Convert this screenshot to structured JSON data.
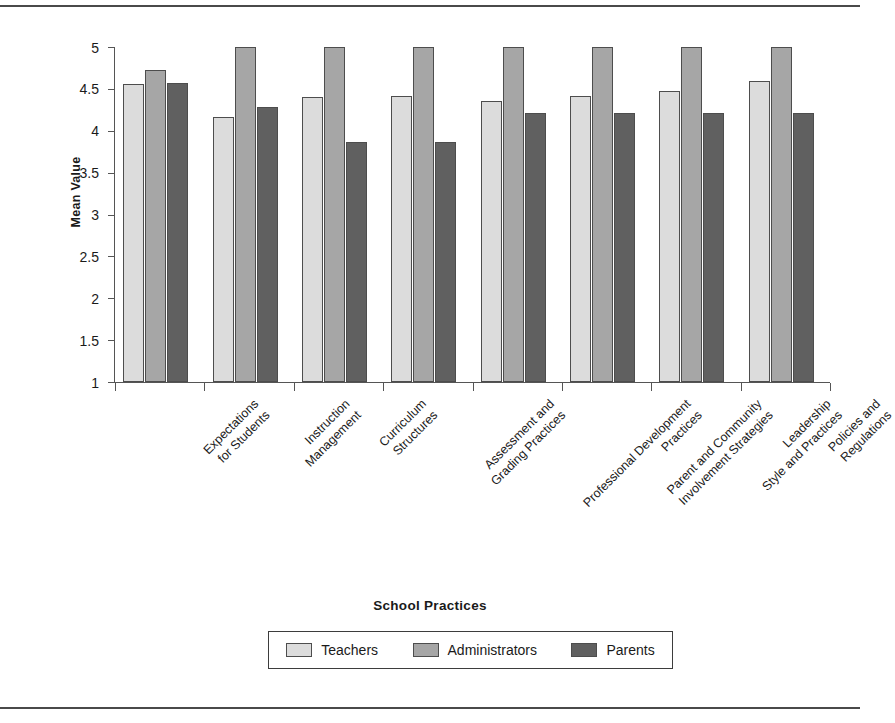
{
  "chart_data": {
    "type": "bar",
    "title": "",
    "xlabel": "School Practices",
    "ylabel": "Mean Value",
    "ylim": [
      1,
      5
    ],
    "ytick_labels": [
      "5",
      "4.5",
      "4",
      "3.5",
      "3",
      "2.5",
      "2",
      "1.5",
      "1"
    ],
    "ytick_values": [
      5,
      4.5,
      4,
      3.5,
      3,
      2.5,
      2,
      1.5,
      1
    ],
    "grid": false,
    "legend_position": "bottom",
    "categories": [
      "Expectations\nfor Students",
      "Instruction\nManagement",
      "Curriculum\nStructures",
      "Assessment and\nGrading Practices",
      "Professional Development\nPractices",
      "Parent and Community\nInvolvement Strategies",
      "Leadership\nStyle and Practices",
      "Policies and\nRegulations"
    ],
    "category_lines": [
      [
        "Expectations",
        "for Students"
      ],
      [
        "Instruction",
        "Management"
      ],
      [
        "Curriculum",
        "Structures"
      ],
      [
        "Assessment and",
        "Grading Practices"
      ],
      [
        "Professional Development",
        "Practices"
      ],
      [
        "Parent and Community",
        "Involvement Strategies"
      ],
      [
        "Leadership",
        "Style and Practices"
      ],
      [
        "Policies and",
        "Regulations"
      ]
    ],
    "series": [
      {
        "name": "Teachers",
        "color": "#dcdcdc",
        "values": [
          4.56,
          4.17,
          4.4,
          4.41,
          4.35,
          4.41,
          4.48,
          4.6
        ]
      },
      {
        "name": "Administrators",
        "color": "#a6a6a6",
        "values": [
          4.72,
          5.0,
          5.0,
          5.0,
          5.0,
          5.0,
          5.0,
          5.0
        ]
      },
      {
        "name": "Parents",
        "color": "#606060",
        "values": [
          4.57,
          4.28,
          3.86,
          3.86,
          4.21,
          4.21,
          4.21,
          4.21
        ]
      }
    ]
  },
  "legend": {
    "items": [
      {
        "label": "Teachers",
        "color": "#dcdcdc"
      },
      {
        "label": "Administrators",
        "color": "#a6a6a6"
      },
      {
        "label": "Parents",
        "color": "#606060"
      }
    ]
  },
  "colors": {
    "teachers": "#dcdcdc",
    "administrators": "#a6a6a6",
    "parents": "#606060",
    "axis": "#555555",
    "text": "#1a1a1a",
    "rule": "#4a4a4a"
  }
}
